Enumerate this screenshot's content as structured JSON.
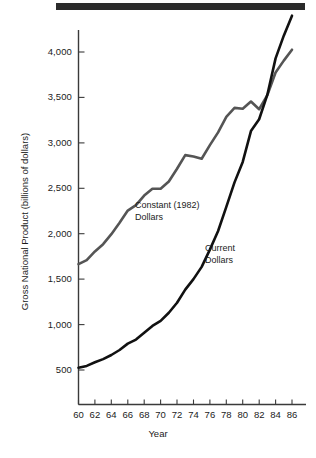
{
  "chart_data": {
    "type": "line",
    "title": "",
    "xlabel": "Year",
    "ylabel": "Gross National Product (billions of dollars)",
    "xlim": [
      60,
      87
    ],
    "ylim": [
      250,
      4150
    ],
    "grid": false,
    "legend_position": "inline-annotation",
    "x_tick_labels": [
      "60",
      "62",
      "64",
      "66",
      "68",
      "70",
      "72",
      "74",
      "76",
      "78",
      "80",
      "82",
      "84",
      "86"
    ],
    "x_tick_values": [
      60,
      62,
      64,
      66,
      68,
      70,
      72,
      74,
      76,
      78,
      80,
      82,
      84,
      86
    ],
    "y_tick_labels": [
      "500",
      "1,000",
      "1,500",
      "2,000",
      "2,500",
      "3,000",
      "3,500",
      "4,000"
    ],
    "y_tick_values": [
      500,
      1000,
      1500,
      2000,
      2500,
      3000,
      3500,
      4000
    ],
    "x": [
      60,
      61,
      62,
      63,
      64,
      65,
      66,
      67,
      68,
      69,
      70,
      71,
      72,
      73,
      74,
      75,
      76,
      77,
      78,
      79,
      80,
      81,
      82,
      83,
      84,
      85,
      86
    ],
    "series": [
      {
        "name": "Current Dollars",
        "color": "#111111",
        "annotation": "Current\nDollars",
        "values": [
          525,
          545,
          585,
          620,
          665,
          720,
          790,
          835,
          910,
          985,
          1040,
          1130,
          1240,
          1385,
          1500,
          1635,
          1825,
          2030,
          2295,
          2565,
          2790,
          3130,
          3260,
          3530,
          3930,
          4180,
          4400
        ]
      },
      {
        "name": "Constant (1982) Dollars",
        "color": "#555555",
        "annotation": "Constant (1982)\nDollars",
        "values": [
          1665,
          1710,
          1805,
          1885,
          1995,
          2120,
          2255,
          2315,
          2420,
          2495,
          2495,
          2575,
          2715,
          2865,
          2850,
          2825,
          2975,
          3115,
          3285,
          3385,
          3375,
          3455,
          3370,
          3525,
          3775,
          3905,
          4025
        ]
      }
    ]
  },
  "banner": {
    "name": "top-rule"
  }
}
